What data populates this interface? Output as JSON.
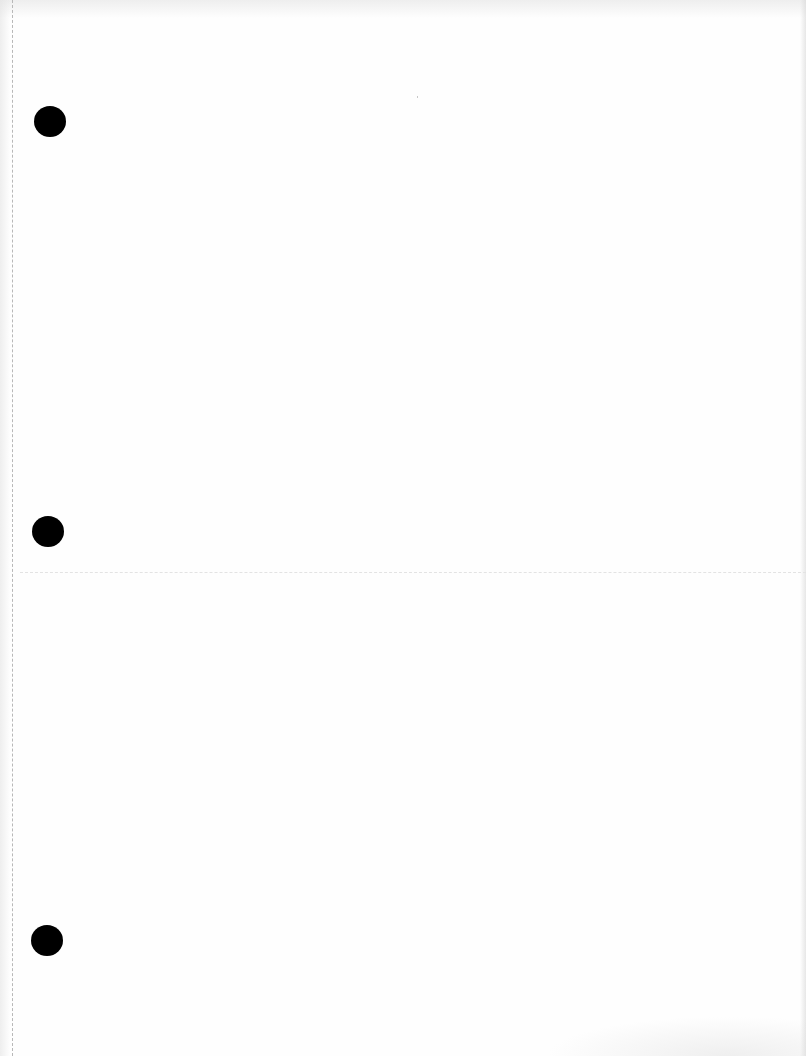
{
  "document": {
    "type": "blank scanned page",
    "text_content": "",
    "binder_holes": [
      {
        "cx": 50,
        "cy": 122
      },
      {
        "cx": 48,
        "cy": 532
      },
      {
        "cx": 47,
        "cy": 940
      }
    ],
    "colors": {
      "paper": "#fefefe",
      "hole": "#000000",
      "margin_line": "#b8b8b8"
    }
  }
}
